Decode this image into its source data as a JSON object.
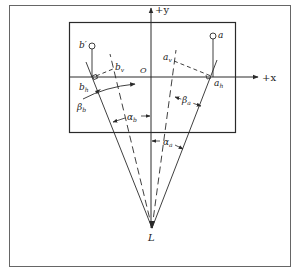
{
  "diagram": {
    "colors": {
      "stroke": "#2a2a2a",
      "frame": "#555555",
      "background": "#ffffff"
    },
    "axes": {
      "x_label": "+x",
      "y_label": "+y",
      "origin_label": "O"
    },
    "points": {
      "a": "a",
      "b_prime": "b′",
      "a_h": "a",
      "a_h_sub": "h",
      "a_v": "a",
      "a_v_sub": "v",
      "b_h": "b",
      "b_h_sub": "h",
      "b_v": "b",
      "b_v_sub": "v",
      "L": "L"
    },
    "angles": {
      "alpha_a": "α",
      "alpha_a_sub": "a",
      "alpha_b": "α",
      "alpha_b_sub": "b",
      "beta_a": "β",
      "beta_a_sub": "a",
      "beta_b": "β",
      "beta_b_sub": "b"
    }
  }
}
